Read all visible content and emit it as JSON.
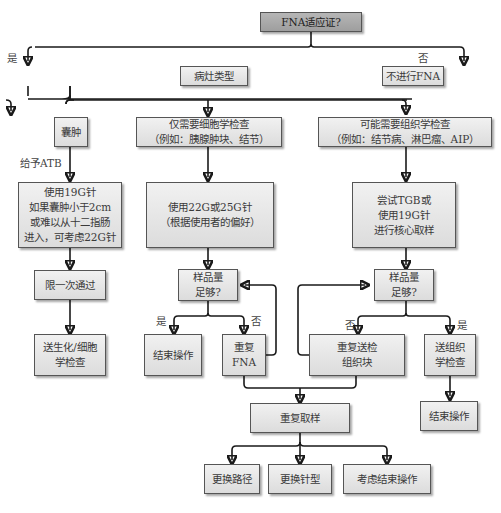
{
  "flowchart": {
    "root": {
      "text": "FNA适应证?"
    },
    "root_branches": {
      "yes": "是",
      "no": "否"
    },
    "lesion_type": {
      "text": "病灶类型"
    },
    "no_fna": {
      "text": "不进行FNA"
    },
    "categories": {
      "cyst": {
        "text": "囊肿"
      },
      "cytology": {
        "text": "仅需要细胞学检查\n（例如：胰腺肿块、结节）"
      },
      "histology": {
        "text": "可能需要组织学检查\n（例如：结节病、淋巴瘤、AIP）"
      }
    },
    "cyst_path": {
      "edge_label": "给予ATB",
      "needle": "使用19G针\n如果囊肿小于2cm\n或难以从十二指肠\n进入，可考虑22G针",
      "passes": "限一次通过",
      "send": "送生化/细胞\n学检查"
    },
    "cytology_path": {
      "needle": "使用22G或25G针\n（根据使用者的偏好）",
      "adequate": "样品量\n足够?",
      "yes_label": "是",
      "no_label": "否",
      "end": "结束操作",
      "repeat": "重复\nFNA"
    },
    "histology_path": {
      "needle": "尝试TGB或\n使用19G针\n进行核心取样",
      "adequate": "样品量\n足够?",
      "no_label": "否",
      "yes_label": "是",
      "repeat": "重复送检\n组织块",
      "send": "送组织\n学检查",
      "end": "结束操作"
    },
    "resample": {
      "text": "重复取样",
      "options": [
        "更换路径",
        "更换针型",
        "考虑结束操作"
      ]
    }
  }
}
